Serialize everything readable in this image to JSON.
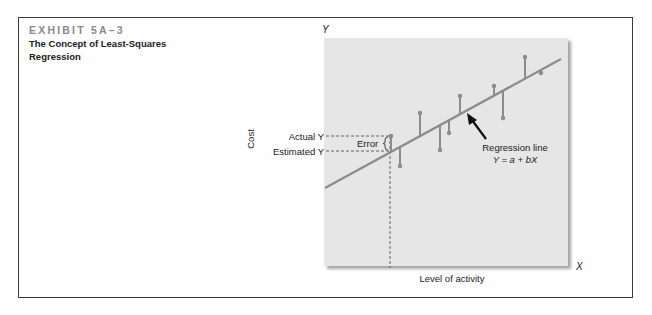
{
  "exhibit": {
    "label": "EXHIBIT 5A–3",
    "title": "The Concept of Least-Squares Regression"
  },
  "chart_data": {
    "type": "scatter",
    "title": "The Concept of Least-Squares Regression",
    "xlabel": "Level of activity",
    "ylabel": "Cost",
    "x_axis_symbol": "X",
    "y_axis_symbol": "Y",
    "grid": false,
    "regression_line": {
      "label": "Regression line",
      "equation": "Y = a + bX"
    },
    "annotations": {
      "actual": "Actual Y",
      "estimated": "Estimated Y",
      "error": "Error"
    },
    "points": [
      {
        "x": 391,
        "actual": 136,
        "estimated": 151
      },
      {
        "x": 400,
        "actual": 166,
        "estimated": 147
      },
      {
        "x": 420,
        "actual": 113,
        "estimated": 137
      },
      {
        "x": 440,
        "actual": 150,
        "estimated": 126
      },
      {
        "x": 449,
        "actual": 133,
        "estimated": 121
      },
      {
        "x": 460,
        "actual": 96,
        "estimated": 115
      },
      {
        "x": 494,
        "actual": 86,
        "estimated": 96
      },
      {
        "x": 503,
        "actual": 118,
        "estimated": 91
      },
      {
        "x": 525,
        "actual": 57,
        "estimated": 79
      },
      {
        "x": 541,
        "actual": 73,
        "estimated": 70
      }
    ],
    "colors": {
      "panel": "#e6e6e6",
      "line": "#8c8c8c",
      "text": "#222222"
    }
  }
}
